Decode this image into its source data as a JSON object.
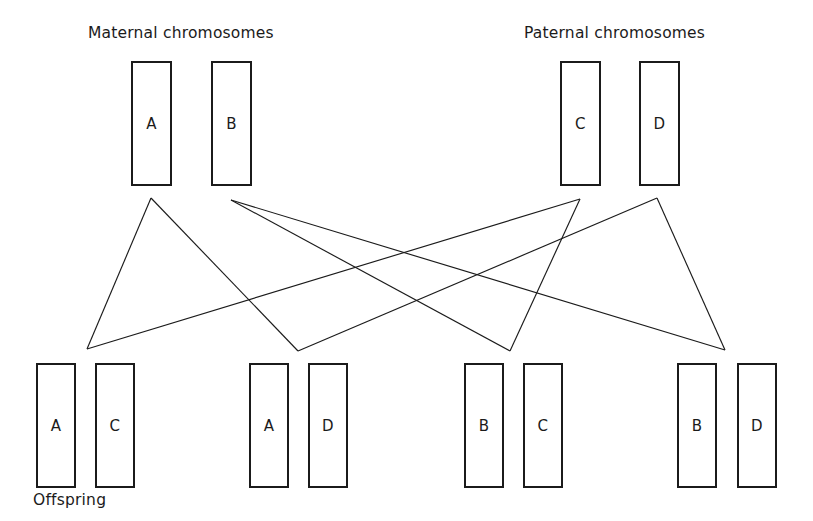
{
  "figure": {
    "width": 813,
    "height": 521,
    "background": "#ffffff",
    "line_color": "#1b1b1b",
    "box_border_color": "#1b1b1b",
    "text_color": "#1b1b1b"
  },
  "captions": {
    "maternal": "Maternal chromosomes",
    "paternal": "Paternal chromosomes",
    "offspring": "Offspring"
  },
  "parents": {
    "maternal": [
      {
        "label": "A",
        "x": 131,
        "y": 61,
        "w": 41,
        "h": 125
      },
      {
        "label": "B",
        "x": 211,
        "y": 61,
        "w": 41,
        "h": 125
      }
    ],
    "paternal": [
      {
        "label": "C",
        "x": 560,
        "y": 61,
        "w": 41,
        "h": 125
      },
      {
        "label": "D",
        "x": 639,
        "y": 61,
        "w": 41,
        "h": 125
      }
    ]
  },
  "offspring": [
    {
      "name": "offspring-1",
      "boxes": [
        {
          "label": "A",
          "x": 36,
          "y": 363,
          "w": 40,
          "h": 125
        },
        {
          "label": "C",
          "x": 95,
          "y": 363,
          "w": 40,
          "h": 125
        }
      ]
    },
    {
      "name": "offspring-2",
      "boxes": [
        {
          "label": "A",
          "x": 249,
          "y": 363,
          "w": 40,
          "h": 125
        },
        {
          "label": "D",
          "x": 308,
          "y": 363,
          "w": 40,
          "h": 125
        }
      ]
    },
    {
      "name": "offspring-3",
      "boxes": [
        {
          "label": "B",
          "x": 464,
          "y": 363,
          "w": 40,
          "h": 125
        },
        {
          "label": "C",
          "x": 523,
          "y": 363,
          "w": 40,
          "h": 125
        }
      ]
    },
    {
      "name": "offspring-4",
      "boxes": [
        {
          "label": "B",
          "x": 677,
          "y": 363,
          "w": 40,
          "h": 125
        },
        {
          "label": "D",
          "x": 737,
          "y": 363,
          "w": 40,
          "h": 125
        }
      ]
    }
  ],
  "caption_positions": {
    "maternal": {
      "x": 88,
      "y": 24
    },
    "paternal": {
      "x": 524,
      "y": 24
    },
    "offspring": {
      "x": 33,
      "y": 491
    }
  },
  "inheritance_lines": [
    {
      "from": "A",
      "to": "offspring-1",
      "x1": 151,
      "y1": 198,
      "x2": 87,
      "y2": 349
    },
    {
      "from": "A",
      "to": "offspring-2",
      "x1": 151,
      "y1": 198,
      "x2": 298,
      "y2": 351
    },
    {
      "from": "B",
      "to": "offspring-3",
      "x1": 231,
      "y1": 200,
      "x2": 510,
      "y2": 351
    },
    {
      "from": "B",
      "to": "offspring-4",
      "x1": 231,
      "y1": 200,
      "x2": 725,
      "y2": 350
    },
    {
      "from": "C",
      "to": "offspring-1",
      "x1": 580,
      "y1": 199,
      "x2": 87,
      "y2": 349
    },
    {
      "from": "C",
      "to": "offspring-3",
      "x1": 580,
      "y1": 199,
      "x2": 510,
      "y2": 351
    },
    {
      "from": "D",
      "to": "offspring-2",
      "x1": 657,
      "y1": 198,
      "x2": 298,
      "y2": 351
    },
    {
      "from": "D",
      "to": "offspring-4",
      "x1": 657,
      "y1": 198,
      "x2": 725,
      "y2": 350
    }
  ]
}
